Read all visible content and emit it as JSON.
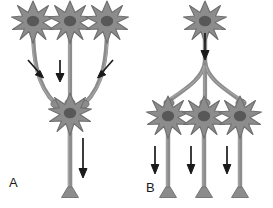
{
  "figure": {
    "background_color": "#ffffff",
    "neuron_fill": "#8c8c8c",
    "neuron_stroke": "#6e6e6e",
    "nucleus_fill": "#5a5a5a",
    "axon_fill": "#8c8c8c",
    "arrow_color": "#1a1a1a"
  },
  "panels": [
    {
      "id": "A",
      "label": "A",
      "concept": "convergence",
      "presynaptic_neuron_count": 3,
      "postsynaptic_neuron_count": 1,
      "arrow_count": 4,
      "arrow_directions": [
        "down-right",
        "down",
        "down-left",
        "down"
      ]
    },
    {
      "id": "B",
      "label": "B",
      "concept": "divergence",
      "presynaptic_neuron_count": 1,
      "postsynaptic_neuron_count": 3,
      "arrow_count": 4,
      "arrow_directions": [
        "down",
        "down",
        "down",
        "down"
      ]
    }
  ],
  "labels": {
    "panel_a": "A",
    "panel_b": "B"
  }
}
